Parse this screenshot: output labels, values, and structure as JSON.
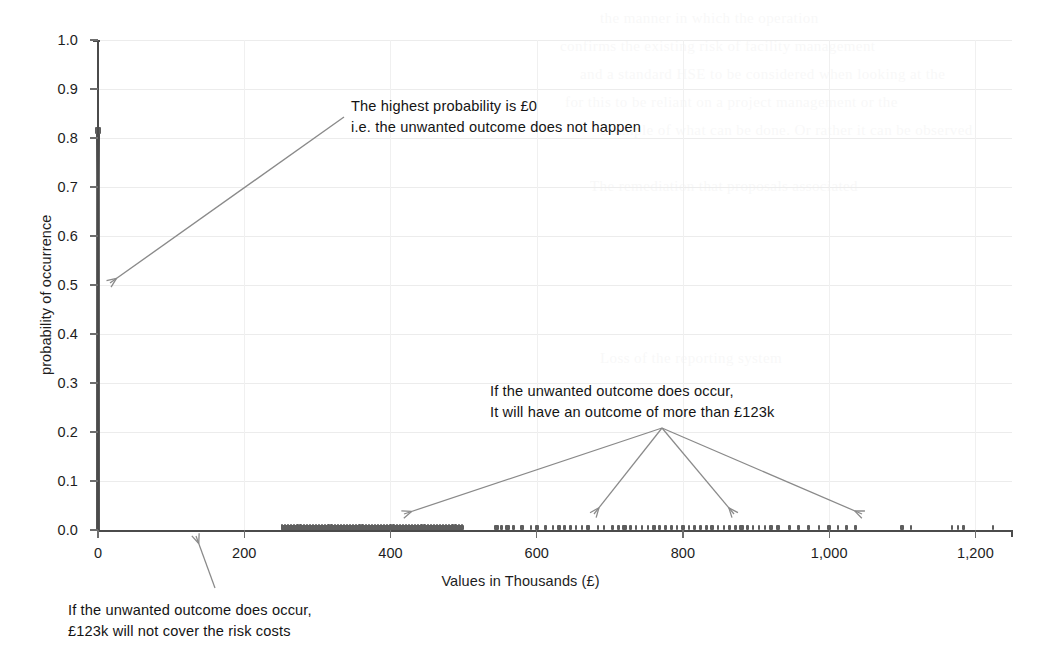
{
  "chart_data": {
    "type": "scatter",
    "title": "",
    "xlabel": "Values in Thousands (£)",
    "ylabel": "probability of occurrence",
    "xlim": [
      0,
      1250
    ],
    "ylim": [
      0.0,
      1.0
    ],
    "grid": true,
    "legend": "none",
    "x_ticks": [
      "0",
      "200",
      "400",
      "600",
      "800",
      "1,000",
      "1,200"
    ],
    "x_tick_values": [
      0,
      200,
      400,
      600,
      800,
      1000,
      1200
    ],
    "y_ticks": [
      "0.0",
      "0.1",
      "0.2",
      "0.3",
      "0.4",
      "0.5",
      "0.6",
      "0.7",
      "0.8",
      "0.9",
      "1.0"
    ],
    "y_tick_values": [
      0.0,
      0.1,
      0.2,
      0.3,
      0.4,
      0.5,
      0.6,
      0.7,
      0.8,
      0.9,
      1.0
    ],
    "series": [
      {
        "name": "zero-outcome-spike",
        "description": "Dense vertical column of points at x = 0 spanning probabilities 0.00 to 0.82",
        "x": 0,
        "y_min": 0.0,
        "y_max": 0.82
      },
      {
        "name": "dense-band",
        "description": "Continuous dense run of near-zero-probability points",
        "x_min": 250,
        "x_max": 500,
        "y": 0.003
      },
      {
        "name": "scattered-tail",
        "description": "Sparse individual points at near-zero probability",
        "y": 0.003,
        "x": [
          545,
          552,
          560,
          568,
          580,
          592,
          600,
          612,
          622,
          630,
          638,
          646,
          654,
          662,
          670,
          684,
          692,
          704,
          712,
          720,
          728,
          736,
          744,
          752,
          760,
          768,
          776,
          784,
          792,
          800,
          808,
          816,
          824,
          832,
          840,
          848,
          856,
          864,
          872,
          880,
          888,
          896,
          904,
          912,
          920,
          930,
          946,
          958,
          972,
          986,
          1000,
          1012,
          1024,
          1036,
          1100,
          1112,
          1168,
          1176,
          1184,
          1224
        ]
      }
    ],
    "annotations": [
      {
        "id": "annotation-zero",
        "lines": [
          "The highest probability is £0",
          "i.e. the unwanted outcome does not happen"
        ],
        "points_to": "x = 0 spike"
      },
      {
        "id": "annotation-outcome",
        "lines": [
          "If the unwanted outcome does occur,",
          "It will have an outcome of more than £123k"
        ],
        "points_to": "scattered points above £250k"
      },
      {
        "id": "annotation-risk-cost",
        "lines": [
          "If the unwanted outcome does occur,",
          "£123k will not cover the risk costs"
        ],
        "points_to": "x = 123 on the value axis"
      }
    ]
  },
  "colors": {
    "marker": "#5e5e5e",
    "axis": "#4b4b4b",
    "gridline": "#ececec",
    "annotation_arrow": "#8a8a8a",
    "text": "#141414",
    "background": "#ffffff"
  },
  "bleed_through": [
    "the manner in which the operation",
    "confirms the existing risk of facility management",
    "and a standard HSE to be considered when looking at the",
    "for this to be reliant on a project management or the",
    "example of what can be done. Or rather it can be observed",
    "The remediation that proposals associated",
    "Loss of the reporting system"
  ]
}
